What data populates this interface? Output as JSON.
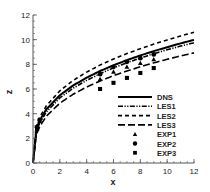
{
  "chart_data": {
    "type": "line",
    "title": "",
    "xlabel": "x",
    "ylabel": "z",
    "xlim": [
      0,
      12
    ],
    "ylim": [
      0,
      12
    ],
    "xticks": [
      0,
      2,
      4,
      6,
      8,
      10,
      12
    ],
    "yticks": [
      0,
      2,
      4,
      6,
      8,
      10,
      12
    ],
    "grid": false,
    "legend_position": "lower right",
    "series": [
      {
        "name": "DNS",
        "style": "solid",
        "x": [
          0,
          0.25,
          0.5,
          1,
          2,
          3,
          4,
          5,
          6,
          7,
          8,
          9,
          10,
          11,
          12
        ],
        "values": [
          0,
          2.75,
          3.46,
          4.36,
          5.49,
          6.29,
          6.92,
          7.46,
          7.92,
          8.34,
          8.72,
          9.07,
          9.39,
          9.7,
          9.98
        ]
      },
      {
        "name": "LES1",
        "style": "dash-dot-dot",
        "x": [
          0,
          0.25,
          0.5,
          1,
          2,
          3,
          4,
          5,
          6,
          7,
          8,
          9,
          10,
          11,
          12
        ],
        "values": [
          0,
          2.55,
          3.25,
          4.15,
          5.28,
          6.07,
          6.7,
          7.24,
          7.71,
          8.13,
          8.51,
          8.86,
          9.18,
          9.48,
          9.75
        ]
      },
      {
        "name": "LES2",
        "style": "short-dash",
        "x": [
          0,
          0.25,
          0.5,
          1,
          2,
          3,
          4,
          5,
          6,
          7,
          8,
          9,
          10,
          11,
          12
        ],
        "values": [
          0,
          2.95,
          3.7,
          4.65,
          5.85,
          6.7,
          7.37,
          7.94,
          8.43,
          8.87,
          9.27,
          9.64,
          9.98,
          10.3,
          10.6
        ]
      },
      {
        "name": "LES3",
        "style": "long-dash",
        "x": [
          0,
          0.25,
          0.5,
          1,
          2,
          3,
          4,
          5,
          6,
          7,
          8,
          9,
          10,
          11,
          12
        ],
        "values": [
          0,
          2.3,
          2.95,
          3.8,
          4.85,
          5.58,
          6.16,
          6.65,
          7.08,
          7.46,
          7.8,
          8.12,
          8.41,
          8.68,
          8.93
        ]
      },
      {
        "name": "EXP1",
        "style": "marker-triangle",
        "x": [
          0.3,
          0.5,
          5,
          6,
          7,
          8,
          9
        ],
        "values": [
          2.8,
          3.4,
          6.8,
          7.4,
          7.8,
          8.1,
          8.4
        ]
      },
      {
        "name": "EXP2",
        "style": "marker-circle",
        "x": [
          0.3,
          0.5,
          5,
          6,
          7,
          8,
          9
        ],
        "values": [
          2.9,
          3.5,
          7.2,
          7.8,
          8.2,
          8.5,
          8.8
        ]
      },
      {
        "name": "EXP3",
        "style": "marker-square",
        "x": [
          5,
          6,
          7,
          8,
          9
        ],
        "values": [
          6.0,
          6.5,
          6.9,
          7.3,
          7.7
        ]
      }
    ]
  },
  "axes": {
    "xlabel": "x",
    "ylabel": "z",
    "xtick_labels": [
      "0",
      "2",
      "4",
      "6",
      "8",
      "10",
      "12"
    ],
    "ytick_labels": [
      "0",
      "2",
      "4",
      "6",
      "8",
      "10",
      "12"
    ]
  },
  "legend": {
    "items": [
      "DNS",
      "LES1",
      "LES2",
      "LES3",
      "EXP1",
      "EXP2",
      "EXP3"
    ]
  },
  "colors": {
    "line": "#000000",
    "axis": "#555555",
    "text": "#222222"
  }
}
